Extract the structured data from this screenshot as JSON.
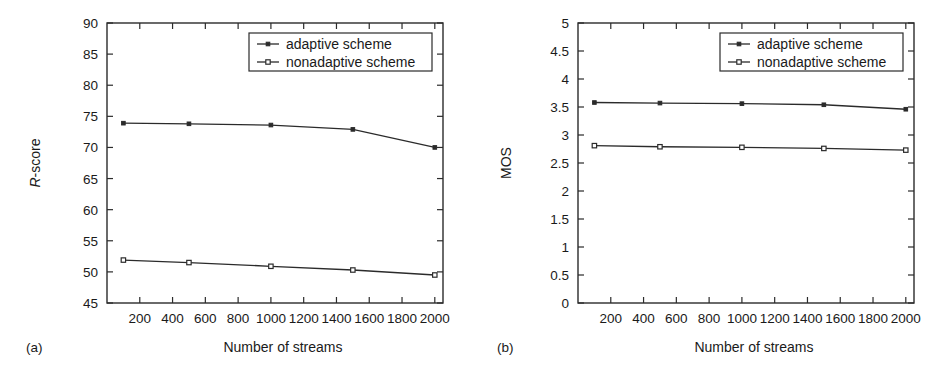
{
  "figure": {
    "background": "#ffffff",
    "ink_color": "#2b2b2b",
    "panel_count": 2
  },
  "chart_data": [
    {
      "type": "line",
      "panel_tag": "(a)",
      "title": "",
      "xlabel": "Number of streams",
      "ylabel": "R-score",
      "ylabel_italic_prefix": "R",
      "ylabel_rest": "-score",
      "x": [
        100,
        500,
        1000,
        1500,
        2000
      ],
      "xlim": [
        0,
        2050
      ],
      "ylim": [
        45,
        90
      ],
      "xticks": [
        200,
        400,
        600,
        800,
        1000,
        1200,
        1400,
        1600,
        1800,
        2000
      ],
      "xticklabels": [
        "200",
        "400",
        "600",
        "800",
        "1000",
        "1200",
        "1400",
        "1600",
        "1800",
        "2000"
      ],
      "yticks": [
        45,
        50,
        55,
        60,
        65,
        70,
        75,
        80,
        85,
        90
      ],
      "yticklabels": [
        "45",
        "50",
        "55",
        "60",
        "65",
        "70",
        "75",
        "80",
        "85",
        "90"
      ],
      "grid": false,
      "legend_position": "upper right",
      "series": [
        {
          "name": "adaptive scheme",
          "marker": "filled-square",
          "values": [
            73.9,
            73.8,
            73.6,
            72.9,
            70.0
          ]
        },
        {
          "name": "nonadaptive scheme",
          "marker": "open-square",
          "values": [
            51.9,
            51.5,
            50.9,
            50.3,
            49.5
          ]
        }
      ]
    },
    {
      "type": "line",
      "panel_tag": "(b)",
      "title": "",
      "xlabel": "Number of streams",
      "ylabel": "MOS",
      "x": [
        100,
        500,
        1000,
        1500,
        2000
      ],
      "xlim": [
        0,
        2050
      ],
      "ylim": [
        0,
        5
      ],
      "xticks": [
        200,
        400,
        600,
        800,
        1000,
        1200,
        1400,
        1600,
        1800,
        2000
      ],
      "xticklabels": [
        "200",
        "400",
        "600",
        "800",
        "1000",
        "1200",
        "1400",
        "1600",
        "1800",
        "2000"
      ],
      "yticks": [
        0,
        0.5,
        1,
        1.5,
        2,
        2.5,
        3,
        3.5,
        4,
        4.5,
        5
      ],
      "yticklabels": [
        "0",
        "0.5",
        "1",
        "1.5",
        "2",
        "2.5",
        "3",
        "3.5",
        "4",
        "4.5",
        "5"
      ],
      "grid": false,
      "legend_position": "upper right",
      "series": [
        {
          "name": "adaptive scheme",
          "marker": "filled-square",
          "values": [
            3.58,
            3.57,
            3.56,
            3.54,
            3.46
          ]
        },
        {
          "name": "nonadaptive scheme",
          "marker": "open-square",
          "values": [
            2.81,
            2.79,
            2.78,
            2.76,
            2.73
          ]
        }
      ]
    }
  ]
}
